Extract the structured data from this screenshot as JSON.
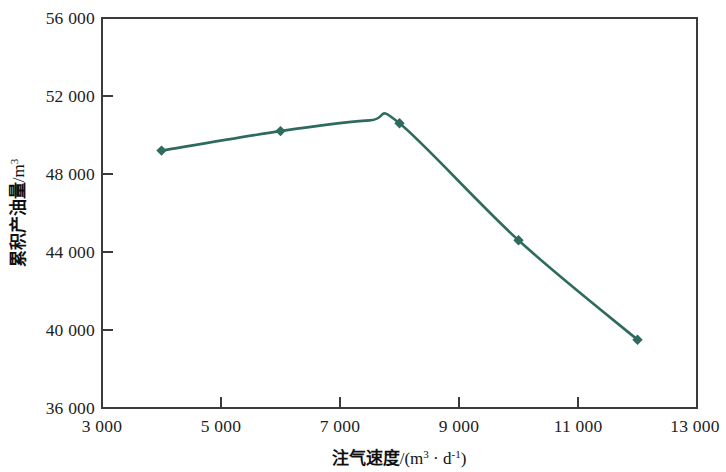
{
  "chart_data": {
    "type": "line",
    "title": "",
    "subtitle": "",
    "xlabel": "注气速度/(m³ · d⁻¹)",
    "ylabel": "累积产油量/m³",
    "xlim": [
      3000,
      13000
    ],
    "ylim": [
      36000,
      56000
    ],
    "grid": false,
    "legend": null,
    "marker": "diamond",
    "line_color": "#2e6b5e",
    "marker_color": "#2e6b5e",
    "x": [
      4000,
      6000,
      8000,
      10000,
      12000
    ],
    "values": [
      49200,
      50200,
      50600,
      44600,
      39500
    ],
    "series": [
      {
        "name": "累积产油量",
        "x": [
          4000,
          6000,
          8000,
          10000,
          12000
        ],
        "values": [
          49200,
          50200,
          50600,
          44600,
          39500
        ]
      }
    ],
    "xticks": [
      3000,
      5000,
      7000,
      9000,
      11000,
      13000
    ],
    "xtick_labels": [
      "3 000",
      "5 000",
      "7 000",
      "9 000",
      "11 000",
      "13 000"
    ],
    "yticks": [
      36000,
      40000,
      44000,
      48000,
      52000,
      56000
    ],
    "ytick_labels": [
      "36 000",
      "40 000",
      "44 000",
      "48 000",
      "52 000",
      "56 000"
    ],
    "peak_x": 7500,
    "peak_value": 50750
  },
  "axis": {
    "y_title_main": "累积产油量",
    "y_title_unit": "/m",
    "y_title_exp": "3",
    "x_title_main": "注气速度",
    "x_title_unit_open": "/(m",
    "x_title_unit_exp1": "3",
    "x_title_unit_mid": " · d",
    "x_title_unit_exp2": "-1",
    "x_title_unit_close": ")"
  }
}
